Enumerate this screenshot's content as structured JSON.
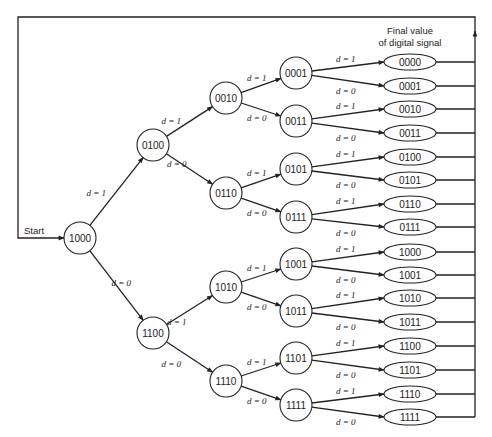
{
  "title": "",
  "header": {
    "line1": "Final value",
    "line2": "of digital signal"
  },
  "start_label": "Start",
  "colors": {
    "stroke": "#222222",
    "background": "#ffffff"
  },
  "nodes": [
    {
      "id": "1000",
      "label": "1000",
      "x": 80,
      "y": 238
    },
    {
      "id": "0100",
      "label": "0100",
      "x": 153,
      "y": 145
    },
    {
      "id": "1100",
      "label": "1100",
      "x": 153,
      "y": 333
    },
    {
      "id": "0010",
      "label": "0010",
      "x": 226,
      "y": 98
    },
    {
      "id": "0110",
      "label": "0110",
      "x": 226,
      "y": 193
    },
    {
      "id": "1010",
      "label": "1010",
      "x": 226,
      "y": 287
    },
    {
      "id": "1110",
      "label": "1110",
      "x": 226,
      "y": 381
    },
    {
      "id": "0001",
      "label": "0001",
      "x": 296,
      "y": 73
    },
    {
      "id": "0011",
      "label": "0011",
      "x": 296,
      "y": 121
    },
    {
      "id": "0101",
      "label": "0101",
      "x": 296,
      "y": 169
    },
    {
      "id": "0111",
      "label": "0111",
      "x": 296,
      "y": 217
    },
    {
      "id": "1001",
      "label": "1001",
      "x": 296,
      "y": 264
    },
    {
      "id": "1011",
      "label": "1011",
      "x": 296,
      "y": 311
    },
    {
      "id": "1101",
      "label": "1101",
      "x": 296,
      "y": 358
    },
    {
      "id": "1111",
      "label": "1111",
      "x": 296,
      "y": 405
    }
  ],
  "finals": [
    {
      "label": "0000",
      "y": 62
    },
    {
      "label": "0001",
      "y": 86
    },
    {
      "label": "0010",
      "y": 109
    },
    {
      "label": "0011",
      "y": 133
    },
    {
      "label": "0100",
      "y": 157
    },
    {
      "label": "0101",
      "y": 180
    },
    {
      "label": "0110",
      "y": 204
    },
    {
      "label": "0111",
      "y": 227
    },
    {
      "label": "1000",
      "y": 252
    },
    {
      "label": "1001",
      "y": 275
    },
    {
      "label": "1010",
      "y": 298
    },
    {
      "label": "1011",
      "y": 322
    },
    {
      "label": "1100",
      "y": 346
    },
    {
      "label": "1101",
      "y": 370
    },
    {
      "label": "1110",
      "y": 394
    },
    {
      "label": "1111",
      "y": 417
    }
  ],
  "edges": [
    {
      "from": "1000",
      "to": "0100",
      "label": "d = 1"
    },
    {
      "from": "1000",
      "to": "1100",
      "label": "d = 0"
    },
    {
      "from": "0100",
      "to": "0010",
      "label": "d = 1"
    },
    {
      "from": "0100",
      "to": "0110",
      "label": "d = 0"
    },
    {
      "from": "1100",
      "to": "1010",
      "label": "d = 1"
    },
    {
      "from": "1100",
      "to": "1110",
      "label": "d = 0"
    },
    {
      "from": "0010",
      "to": "0001",
      "label": "d = 1"
    },
    {
      "from": "0010",
      "to": "0011",
      "label": "d = 0"
    },
    {
      "from": "0110",
      "to": "0101",
      "label": "d = 1"
    },
    {
      "from": "0110",
      "to": "0111",
      "label": "d = 0"
    },
    {
      "from": "1010",
      "to": "1001",
      "label": "d = 1"
    },
    {
      "from": "1010",
      "to": "1011",
      "label": "d = 0"
    },
    {
      "from": "1110",
      "to": "1101",
      "label": "d = 1"
    },
    {
      "from": "1110",
      "to": "1111",
      "label": "d = 0"
    },
    {
      "from": "0001",
      "to": "final:0",
      "label": "d = 1"
    },
    {
      "from": "0001",
      "to": "final:1",
      "label": "d = 0"
    },
    {
      "from": "0011",
      "to": "final:2",
      "label": "d = 1"
    },
    {
      "from": "0011",
      "to": "final:3",
      "label": "d = 0"
    },
    {
      "from": "0101",
      "to": "final:4",
      "label": "d = 1"
    },
    {
      "from": "0101",
      "to": "final:5",
      "label": "d = 0"
    },
    {
      "from": "0111",
      "to": "final:6",
      "label": "d = 1"
    },
    {
      "from": "0111",
      "to": "final:7",
      "label": "d = 0"
    },
    {
      "from": "1001",
      "to": "final:8",
      "label": "d = 1"
    },
    {
      "from": "1001",
      "to": "final:9",
      "label": "d = 0"
    },
    {
      "from": "1011",
      "to": "final:10",
      "label": "d = 1"
    },
    {
      "from": "1011",
      "to": "final:11",
      "label": "d = 0"
    },
    {
      "from": "1101",
      "to": "final:12",
      "label": "d = 1"
    },
    {
      "from": "1101",
      "to": "final:13",
      "label": "d = 0"
    },
    {
      "from": "1111",
      "to": "final:14",
      "label": "d = 1"
    },
    {
      "from": "1111",
      "to": "final:15",
      "label": "d = 0"
    }
  ],
  "layout": {
    "node_radius": 16,
    "final_cx": 410,
    "final_rx": 26,
    "final_ry": 8,
    "bus_x": 475,
    "top_y": 17,
    "left_x": 18,
    "start_y": 238
  }
}
